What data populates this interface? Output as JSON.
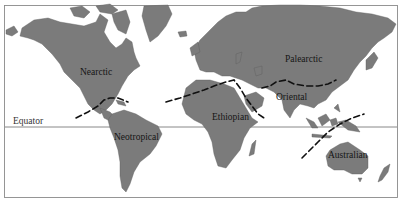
{
  "map": {
    "type": "world-zoogeographic-regions",
    "colors": {
      "land": "#7b7b7b",
      "ocean": "#ffffff",
      "boundary": "#111111",
      "equator": "#6a6a6a",
      "frame": "#8a8a8a"
    },
    "equator_label": "Equator",
    "regions": [
      {
        "id": "nearctic",
        "label": "Nearctic"
      },
      {
        "id": "palearctic",
        "label": "Palearctic"
      },
      {
        "id": "oriental",
        "label": "Oriental"
      },
      {
        "id": "neotropical",
        "label": "Neotropical"
      },
      {
        "id": "ethiopian",
        "label": "Ethiopian"
      },
      {
        "id": "australian",
        "label": "Australian"
      }
    ]
  }
}
